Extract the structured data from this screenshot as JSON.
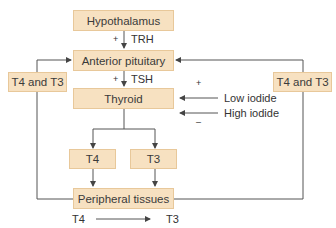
{
  "diagram": {
    "nodes": {
      "hypothalamus": "Hypothalamus",
      "anterior_pituitary": "Anterior pituitary",
      "thyroid": "Thyroid",
      "t4": "T4",
      "t3": "T3",
      "peripheral": "Peripheral tissues",
      "feedback_left": "T4 and T3",
      "feedback_right": "T4 and T3"
    },
    "edges": {
      "trh": "TRH",
      "tsh": "TSH",
      "trh_sign": "+",
      "tsh_sign": "+",
      "low_iodide": "Low iodide",
      "high_iodide": "High iodide",
      "low_sign": "+",
      "high_sign": "–",
      "conversion_from": "T4",
      "conversion_to": "T3"
    },
    "colors": {
      "box_fill": "#f7e1c1",
      "box_border": "#e8c89a",
      "line": "#444444"
    }
  }
}
